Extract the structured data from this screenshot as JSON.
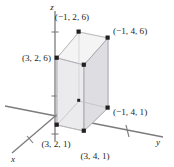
{
  "figure": {
    "type": "3d-coordinate-diagram",
    "axes": {
      "x_label": "x",
      "y_label": "y",
      "z_label": "z"
    },
    "colors": {
      "ink": "#231f20",
      "axis": "#6e6e70",
      "box_edge": "#a9a9ad",
      "box_face_light": "#f2f2f3",
      "box_face_mid": "#e4e4e6",
      "box_face_dark": "#d6d6d9",
      "background": "#ffffff"
    },
    "vertices": [
      {
        "name": "top-back-left",
        "label": "(−1, 2, 6)",
        "coords": [
          -1,
          2,
          6
        ],
        "px": [
          79,
          32
        ],
        "label_px": [
          70,
          20
        ],
        "anchor": "middle"
      },
      {
        "name": "top-back-right",
        "label": "(−1, 4, 6)",
        "coords": [
          -1,
          4,
          6
        ],
        "px": [
          108,
          38
        ],
        "label_px": [
          113,
          36
        ],
        "anchor": "start"
      },
      {
        "name": "top-front-left",
        "label": "(3, 2, 6)",
        "coords": [
          3,
          2,
          6
        ],
        "px": [
          57,
          58
        ],
        "label_px": [
          52,
          61
        ],
        "anchor": "end"
      },
      {
        "name": "top-front-right",
        "label": "",
        "coords": [
          3,
          4,
          6
        ],
        "px": [
          84,
          65
        ],
        "label_px": [
          84,
          65
        ],
        "anchor": "middle"
      },
      {
        "name": "bottom-back-right",
        "label": "(−1, 4, 1)",
        "coords": [
          -1,
          4,
          1
        ],
        "px": [
          108,
          108
        ],
        "label_px": [
          113,
          114
        ],
        "anchor": "start"
      },
      {
        "name": "bottom-front-left",
        "label": "(3, 2, 1)",
        "coords": [
          3,
          2,
          1
        ],
        "px": [
          57,
          125
        ],
        "label_px": [
          55,
          143
        ],
        "anchor": "middle"
      },
      {
        "name": "bottom-front-right",
        "label": "(3, 4, 1)",
        "coords": [
          3,
          4,
          1
        ],
        "px": [
          84,
          131
        ],
        "label_px": [
          93,
          156
        ],
        "anchor": "middle"
      }
    ],
    "hidden_vertex": {
      "name": "bottom-back-left",
      "coords": [
        -1,
        2,
        1
      ],
      "px": [
        79,
        101
      ]
    }
  }
}
